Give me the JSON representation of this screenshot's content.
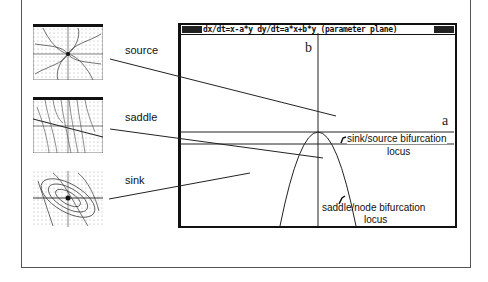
{
  "figure": {
    "plot": {
      "title": "dx/dt=x-a*y dy/dt=a*x+b*y (parameter plane)",
      "axis_x_label": "a",
      "axis_y_label": "b",
      "annotations": {
        "sink_source": "sink/source bifurcation",
        "sink_source_locus": "locus",
        "saddle_node": "saddle/node  bifurcation",
        "saddle_node_locus": "locus"
      }
    },
    "phase_portraits": [
      {
        "label": "source",
        "type": "spiral-source"
      },
      {
        "label": "saddle",
        "type": "saddle"
      },
      {
        "label": "sink",
        "type": "spiral-sink"
      }
    ],
    "colors": {
      "ink": "#111111",
      "frame": "#555555",
      "background": "#ffffff"
    }
  }
}
